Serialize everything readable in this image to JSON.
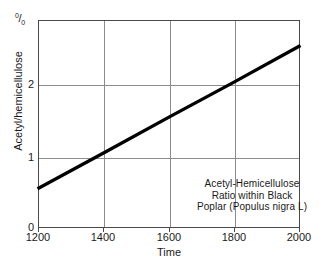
{
  "chart_data": {
    "type": "line",
    "title": "",
    "annotation_lines": [
      "Acetyl-Hemicellulose",
      "Ratio within Black",
      "Poplar (Populus nigra L)"
    ],
    "xlabel": "Time",
    "ylabel": "Acetyl/hemicellulose",
    "yunit": "%",
    "yunit_display": {
      "sup": "0",
      "slash": "/",
      "sub": "0"
    },
    "xlim": [
      1200,
      2000
    ],
    "ylim": [
      0,
      3
    ],
    "xticks": [
      1200,
      1400,
      1600,
      1800,
      2000
    ],
    "xtick_labels": [
      "1200",
      "1400",
      "1600",
      "1800",
      "2000"
    ],
    "yticks": [
      0,
      1,
      2
    ],
    "ytick_labels": [
      "0",
      "1",
      "2"
    ],
    "grid": "both",
    "legend": "none",
    "series": [
      {
        "name": "Acetyl/hemicellulose ratio",
        "color": "#000000",
        "linewidth": 3,
        "x": [
          1200,
          1400,
          1600,
          1800,
          2000
        ],
        "y": [
          0.57,
          1.08,
          1.6,
          2.11,
          2.63
        ]
      }
    ]
  }
}
